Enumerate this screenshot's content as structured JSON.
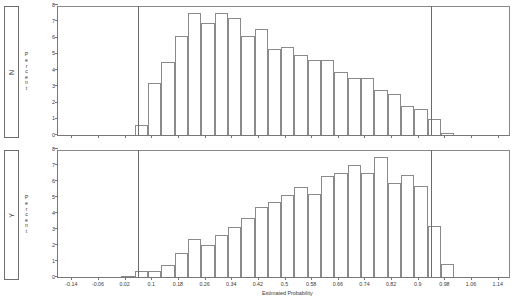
{
  "chart_data": {
    "type": "bar",
    "title": "",
    "xlabel": "Estimated Probability",
    "ylabel": "Percent",
    "ylim": [
      0,
      8
    ],
    "xlim": [
      -0.18,
      1.18
    ],
    "grid": false,
    "legend": "none",
    "bin_width": 0.02,
    "y_ticks": [
      "0",
      "1",
      "2",
      "3",
      "4",
      "5",
      "6",
      "7",
      "8"
    ],
    "x_ticks": [
      "-0.14",
      "-0.06",
      "0.02",
      "0.1",
      "0.18",
      "0.26",
      "0.34",
      "0.42",
      "0.5",
      "0.58",
      "0.66",
      "0.74",
      "0.82",
      "0.9",
      "0.98",
      "1.06",
      "1.14"
    ],
    "x_tick_values": [
      -0.14,
      -0.06,
      0.02,
      0.1,
      0.18,
      0.26,
      0.34,
      0.42,
      0.5,
      0.58,
      0.66,
      0.74,
      0.82,
      0.9,
      0.98,
      1.06,
      1.14
    ],
    "reference_lines": [
      0.06,
      0.94
    ],
    "panels": [
      {
        "strip_label": "N",
        "ylabel": "Percent",
        "bins": [
          {
            "x": 0.07,
            "value": 0.6
          },
          {
            "x": 0.11,
            "value": 3.2
          },
          {
            "x": 0.15,
            "value": 4.5
          },
          {
            "x": 0.19,
            "value": 6.1
          },
          {
            "x": 0.23,
            "value": 7.5
          },
          {
            "x": 0.27,
            "value": 6.9
          },
          {
            "x": 0.31,
            "value": 7.5
          },
          {
            "x": 0.35,
            "value": 7.2
          },
          {
            "x": 0.39,
            "value": 6.1
          },
          {
            "x": 0.43,
            "value": 6.5
          },
          {
            "x": 0.47,
            "value": 5.3
          },
          {
            "x": 0.51,
            "value": 5.4
          },
          {
            "x": 0.55,
            "value": 4.9
          },
          {
            "x": 0.59,
            "value": 4.6
          },
          {
            "x": 0.63,
            "value": 4.6
          },
          {
            "x": 0.67,
            "value": 3.9
          },
          {
            "x": 0.71,
            "value": 3.5
          },
          {
            "x": 0.75,
            "value": 3.5
          },
          {
            "x": 0.79,
            "value": 2.8
          },
          {
            "x": 0.83,
            "value": 2.5
          },
          {
            "x": 0.87,
            "value": 1.8
          },
          {
            "x": 0.91,
            "value": 1.6
          },
          {
            "x": 0.95,
            "value": 1.0
          },
          {
            "x": 0.99,
            "value": 0.15
          }
        ]
      },
      {
        "strip_label": "Y",
        "ylabel": "Percent",
        "bins": [
          {
            "x": 0.03,
            "value": 0.05
          },
          {
            "x": 0.07,
            "value": 0.35
          },
          {
            "x": 0.11,
            "value": 0.4
          },
          {
            "x": 0.15,
            "value": 0.75
          },
          {
            "x": 0.19,
            "value": 1.5
          },
          {
            "x": 0.23,
            "value": 2.4
          },
          {
            "x": 0.27,
            "value": 2.0
          },
          {
            "x": 0.31,
            "value": 2.6
          },
          {
            "x": 0.35,
            "value": 3.1
          },
          {
            "x": 0.39,
            "value": 3.7
          },
          {
            "x": 0.43,
            "value": 4.4
          },
          {
            "x": 0.47,
            "value": 4.7
          },
          {
            "x": 0.51,
            "value": 5.1
          },
          {
            "x": 0.55,
            "value": 5.6
          },
          {
            "x": 0.59,
            "value": 5.2
          },
          {
            "x": 0.63,
            "value": 6.3
          },
          {
            "x": 0.67,
            "value": 6.5
          },
          {
            "x": 0.71,
            "value": 7.0
          },
          {
            "x": 0.75,
            "value": 6.5
          },
          {
            "x": 0.79,
            "value": 7.5
          },
          {
            "x": 0.83,
            "value": 5.9
          },
          {
            "x": 0.87,
            "value": 6.4
          },
          {
            "x": 0.91,
            "value": 5.7
          },
          {
            "x": 0.95,
            "value": 3.2
          },
          {
            "x": 0.99,
            "value": 0.8
          }
        ]
      }
    ]
  }
}
